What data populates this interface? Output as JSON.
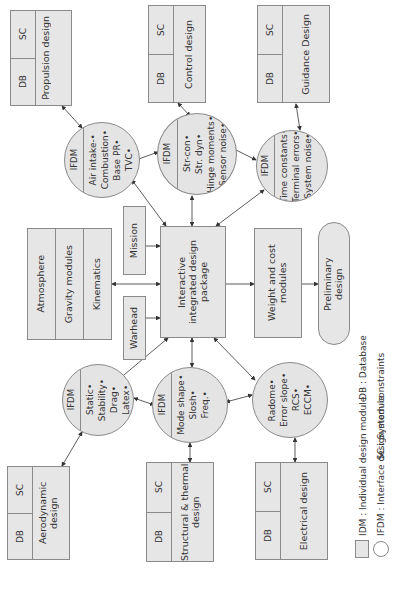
{
  "diagram": {
    "center": {
      "label": "Interactive integrated design package"
    },
    "idm_modules": [
      {
        "id": "propulsion",
        "label": "Propulsion design",
        "db": "DB",
        "sc": "SC"
      },
      {
        "id": "control",
        "label": "Control design",
        "db": "DB",
        "sc": "SC"
      },
      {
        "id": "guidance",
        "label": "Guidance Design",
        "db": "DB",
        "sc": "SC"
      },
      {
        "id": "aerodynamic",
        "label": "Aerodynamic design",
        "db": "DB",
        "sc": "SC"
      },
      {
        "id": "structural",
        "label": "Structural & thermal design",
        "db": "DB",
        "sc": "SC"
      },
      {
        "id": "electrical",
        "label": "Electrical design",
        "db": "DB",
        "sc": "SC"
      }
    ],
    "ifdm_modules": [
      {
        "id": "propulsion-ifdm",
        "header": "IFDM",
        "items": [
          "Air intake-",
          "Combustion",
          "Base PR",
          "TVC"
        ]
      },
      {
        "id": "control-ifdm",
        "header": "IFDM",
        "items": [
          "Str-con",
          "Str. dyn",
          "Hinge moments",
          "Sensor noise"
        ]
      },
      {
        "id": "guidance-ifdm",
        "header": "IFDM",
        "items": [
          "Time constants",
          "Terminal errors",
          "System noise"
        ]
      },
      {
        "id": "aero-ifdm",
        "header": "IFDM",
        "items": [
          "Static",
          "Stability",
          "Drag",
          "Latex"
        ]
      },
      {
        "id": "structural-ifdm",
        "header": "IFDM",
        "items": [
          "Mode shape",
          "Slosh",
          "Freq."
        ]
      },
      {
        "id": "electrical-ifdm",
        "header": "",
        "items": [
          "Radome",
          "Error slope",
          "RCS",
          "ECCM"
        ]
      }
    ],
    "environment_stack": [
      "Atmosphere",
      "Gravity modules",
      "Kinematics"
    ],
    "inputs": [
      "Mission",
      "Warhead"
    ],
    "weight_cost": "Weight and cost modules",
    "preliminary": "Preliminary design",
    "legend": {
      "db": "DB : Database",
      "sc": "SC : System constraints",
      "idm": "IDM : Individual design module",
      "ifdm": "IFDM : Interface design module"
    }
  },
  "colors": {
    "fill": "#e6e6e6",
    "stroke": "#8a8a8a",
    "text": "#333333"
  }
}
